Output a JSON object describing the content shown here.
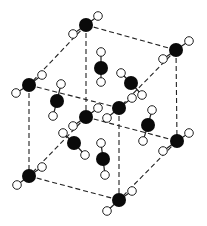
{
  "diagram": {
    "type": "crystal-unit-cell",
    "colors": {
      "background": "#ffffff",
      "edge": "#222222",
      "heavy_atom": "#0a0a0a",
      "hydrogen_fill": "#ffffff",
      "hydrogen_stroke": "#222222"
    },
    "corners": {
      "back_top_left": {
        "x": 86,
        "y": 25
      },
      "back_top_right": {
        "x": 176,
        "y": 50
      },
      "front_top_left": {
        "x": 29,
        "y": 85
      },
      "front_top_right": {
        "x": 119,
        "y": 108
      },
      "back_bottom_left": {
        "x": 86,
        "y": 117
      },
      "back_bottom_right": {
        "x": 177,
        "y": 141
      },
      "front_bottom_left": {
        "x": 29,
        "y": 176
      },
      "front_bottom_right": {
        "x": 119,
        "y": 200
      }
    },
    "edges": [
      [
        "back_top_left",
        "back_top_right"
      ],
      [
        "back_top_left",
        "front_top_left"
      ],
      [
        "back_top_right",
        "front_top_right"
      ],
      [
        "front_top_left",
        "front_top_right"
      ],
      [
        "back_bottom_left",
        "back_bottom_right"
      ],
      [
        "back_bottom_left",
        "front_bottom_left"
      ],
      [
        "back_bottom_right",
        "front_bottom_right"
      ],
      [
        "front_bottom_left",
        "front_bottom_right"
      ],
      [
        "back_top_left",
        "back_bottom_left"
      ],
      [
        "back_top_right",
        "back_bottom_right"
      ],
      [
        "front_top_left",
        "front_bottom_left"
      ],
      [
        "front_top_right",
        "front_bottom_right"
      ]
    ],
    "molecules": [
      {
        "name": "corner-back-top-left",
        "c": [
          86,
          25
        ],
        "h": [
          [
            98,
            16
          ],
          [
            73,
            34
          ]
        ]
      },
      {
        "name": "corner-back-top-right",
        "c": [
          176,
          50
        ],
        "h": [
          [
            189,
            41
          ],
          [
            163,
            59
          ]
        ]
      },
      {
        "name": "corner-front-top-left",
        "c": [
          29,
          85
        ],
        "h": [
          [
            42,
            75
          ],
          [
            16,
            93
          ]
        ]
      },
      {
        "name": "corner-front-top-right",
        "c": [
          119,
          108
        ],
        "h": [
          [
            132,
            98
          ],
          [
            107,
            118
          ]
        ]
      },
      {
        "name": "corner-back-bottom-left",
        "c": [
          86,
          117
        ],
        "h": [
          [
            98,
            108
          ],
          [
            73,
            126
          ]
        ]
      },
      {
        "name": "corner-back-bottom-right",
        "c": [
          177,
          141
        ],
        "h": [
          [
            189,
            133
          ],
          [
            163,
            151
          ]
        ]
      },
      {
        "name": "corner-front-bottom-left",
        "c": [
          29,
          176
        ],
        "h": [
          [
            42,
            167
          ],
          [
            17,
            185
          ]
        ]
      },
      {
        "name": "corner-front-bottom-right",
        "c": [
          119,
          200
        ],
        "h": [
          [
            132,
            191
          ],
          [
            107,
            211
          ]
        ]
      },
      {
        "name": "face-top-inner",
        "c": [
          101,
          68
        ],
        "h": [
          [
            101,
            52
          ],
          [
            101,
            82
          ]
        ]
      },
      {
        "name": "face-top-right-inner",
        "c": [
          131,
          83
        ],
        "h": [
          [
            121,
            73
          ],
          [
            142,
            95
          ]
        ]
      },
      {
        "name": "face-left-inner",
        "c": [
          57,
          101
        ],
        "h": [
          [
            61,
            84
          ],
          [
            53,
            116
          ]
        ]
      },
      {
        "name": "face-right-inner",
        "c": [
          148,
          125
        ],
        "h": [
          [
            152,
            110
          ],
          [
            143,
            141
          ]
        ]
      },
      {
        "name": "face-front-inner",
        "c": [
          74,
          143
        ],
        "h": [
          [
            63,
            133
          ],
          [
            85,
            155
          ]
        ]
      },
      {
        "name": "face-bottom-inner",
        "c": [
          103,
          159
        ],
        "h": [
          [
            101,
            143
          ],
          [
            105,
            175
          ]
        ]
      }
    ],
    "radii": {
      "heavy": 7,
      "hydrogen": 4.3
    }
  }
}
